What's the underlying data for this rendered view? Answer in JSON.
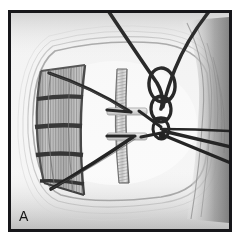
{
  "figure": {
    "panel_label": "A",
    "type": "photograph",
    "modality": "grayscale-photograph",
    "frame": {
      "border_color": "#17171a",
      "border_width_px": 3,
      "outer_margin_color": "#ffffff"
    },
    "palette": {
      "background_white": "#ffffff",
      "scene_light": "#fafafa",
      "scene_mid": "#d9d9d9",
      "scene_shadow": "#bdbdbd",
      "suture_dark": "#1b1b1e",
      "suture_mid": "#3a3a3e",
      "tissue_dark": "#8c8c8c",
      "label_color": "#161616"
    },
    "elements": [
      {
        "name": "tray-basin-outline",
        "description": "rounded rectangular basin or tray outline filling the scene",
        "tone": "light-gray"
      },
      {
        "name": "ribbed-ladder-structure",
        "description": "curved ribbed ladder-like structure with fine comb teeth on the left side",
        "position": "left",
        "rungs": 4
      },
      {
        "name": "central-vertical-band",
        "description": "narrow vertical striped band running top to bottom at center",
        "position": "center"
      },
      {
        "name": "suture-chain-loops",
        "description": "chain of three interlocking dark suture loops descending from upper right",
        "loop_count": 3,
        "position": "upper-right-of-center"
      },
      {
        "name": "suture-strands",
        "description": "dark suture threads converging from the left structure to a central node and exiting right",
        "strand_count": 6
      },
      {
        "name": "tissue-shadow-right",
        "description": "darker gradient tissue mass at the right edge",
        "position": "right-edge"
      },
      {
        "name": "connector-bars",
        "description": "two pale horizontal connector bars crossing the central band",
        "count": 2
      }
    ]
  }
}
